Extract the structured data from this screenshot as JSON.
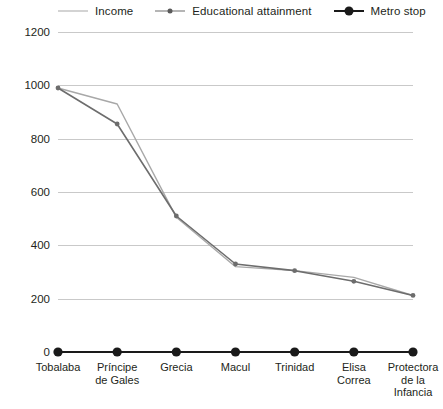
{
  "legend": {
    "items": [
      {
        "label": "Income",
        "color": "#a8a8a8",
        "marker": "none",
        "icon": "line-swatch-icon"
      },
      {
        "label": "Educational attainment",
        "color": "#6d6d6d",
        "marker": "small-dot",
        "icon": "line-dot-swatch-icon"
      },
      {
        "label": "Metro stop",
        "color": "#1a1a1a",
        "marker": "large-dot",
        "icon": "line-bigdot-swatch-icon"
      }
    ]
  },
  "axis": {
    "y_ticks": [
      "0",
      "200",
      "400",
      "600",
      "800",
      "1000",
      "1200"
    ],
    "x_labels": [
      "Tobalaba",
      "Príncipe\nde Gales",
      "Grecia",
      "Macul",
      "Trinidad",
      "Elisa\nCorrea",
      "Protectora\nde la\nInfancia"
    ]
  },
  "chart_data": {
    "type": "line",
    "title": "",
    "xlabel": "",
    "ylabel": "",
    "ylim": [
      0,
      1200
    ],
    "ytick_step": 200,
    "grid": true,
    "legend_position": "top",
    "categories": [
      "Tobalaba",
      "Príncipe de Gales",
      "Grecia",
      "Macul",
      "Trinidad",
      "Elisa Correa",
      "Protectora de la Infancia"
    ],
    "series": [
      {
        "name": "Income",
        "color": "#a8a8a8",
        "marker": "none",
        "values": [
          990,
          930,
          505,
          320,
          305,
          280,
          212
        ]
      },
      {
        "name": "Educational attainment",
        "color": "#6d6d6d",
        "marker": "small-dot",
        "values": [
          990,
          855,
          510,
          330,
          305,
          265,
          212
        ]
      },
      {
        "name": "Metro stop",
        "color": "#1a1a1a",
        "marker": "large-dot",
        "values": [
          0,
          0,
          0,
          0,
          0,
          0,
          0
        ]
      }
    ]
  }
}
